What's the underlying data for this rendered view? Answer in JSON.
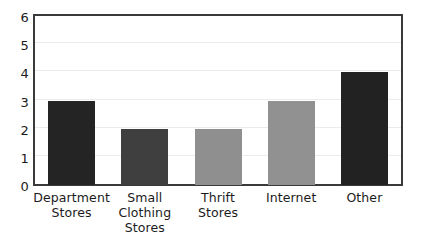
{
  "chart_data": {
    "type": "bar",
    "title": "",
    "subtitle": "",
    "xlabel": "",
    "ylabel": "",
    "categories": [
      "Department Stores",
      "Small Clothing Stores",
      "Thrift Stores",
      "Internet",
      "Other"
    ],
    "category_lines": [
      [
        "Department",
        "Stores"
      ],
      [
        "Small Clothing",
        "Stores"
      ],
      [
        "Thrift",
        "Stores"
      ],
      [
        "Internet",
        ""
      ],
      [
        "Other",
        ""
      ]
    ],
    "values": [
      3,
      2,
      2,
      3,
      4
    ],
    "bar_colors": [
      "#242424",
      "#3f3f3f",
      "#8f8f8f",
      "#919191",
      "#222222"
    ],
    "ylim": [
      0,
      6
    ],
    "ytick_labels": [
      "0",
      "1",
      "2",
      "3",
      "4",
      "5",
      "6"
    ],
    "ytick_values": [
      0,
      1,
      2,
      3,
      4,
      5,
      6
    ],
    "xlim_note": "categorical",
    "grid": true,
    "grid_axis": "y",
    "grid_color": "#ebebeb",
    "frame_color": "#3a3a3a",
    "background_color": "#ffffff",
    "legend": null,
    "legend_position": "none",
    "annotations": [],
    "style": "hand-drawn"
  }
}
